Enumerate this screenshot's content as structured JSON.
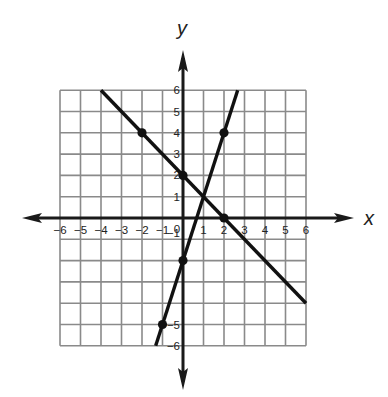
{
  "chart_data": {
    "type": "line",
    "title": "",
    "xlabel": "x",
    "ylabel": "y",
    "xlim": [
      -6,
      6
    ],
    "ylim": [
      -6,
      6
    ],
    "grid": true,
    "x_ticks": [
      "-6",
      "-5",
      "-4",
      "-3",
      "-2",
      "-1",
      "0",
      "1",
      "2",
      "3",
      "4",
      "5",
      "6"
    ],
    "y_ticks": [
      "6",
      "5",
      "4",
      "3",
      "2",
      "1",
      "-1",
      "-5",
      "-6"
    ],
    "series": [
      {
        "name": "line-decreasing",
        "equation": "y = -x + 2",
        "segment": [
          [
            -4,
            6
          ],
          [
            6,
            -4
          ]
        ],
        "points": [
          [
            -2,
            4
          ],
          [
            0,
            2
          ],
          [
            2,
            0
          ]
        ]
      },
      {
        "name": "line-increasing",
        "equation": "y = 3x - 2",
        "segment": [
          [
            -1.333,
            -6
          ],
          [
            2.667,
            6
          ]
        ],
        "points": [
          [
            -1,
            -5
          ],
          [
            0,
            -2
          ],
          [
            2,
            4
          ]
        ]
      }
    ],
    "intersection": [
      1,
      1
    ]
  },
  "colors": {
    "grid": "#8a8a8a",
    "axis": "#1a1a1a",
    "line": "#111111"
  },
  "labels": {
    "x_axis": "x",
    "y_axis": "y",
    "origin": "0"
  }
}
